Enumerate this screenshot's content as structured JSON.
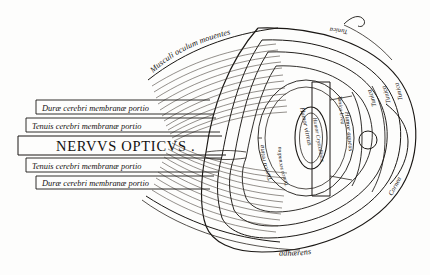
{
  "figure": {
    "kind": "anatomical-engraving",
    "language": "Latin",
    "ink_color": "#1a1714",
    "paper_color": "#fdfdfc"
  },
  "title_banner": {
    "text": "NERVVS OPTICVS .",
    "style": "roman-capitals"
  },
  "nerve_bands": [
    {
      "id": "band-1",
      "text": "Duræ cerebri membranæ portio"
    },
    {
      "id": "band-2",
      "text": "Tenuis cerebri membranæ portio"
    },
    {
      "id": "band-3",
      "text": "NERVVS OPTICVS .",
      "is_title": true
    },
    {
      "id": "band-4",
      "text": "Tenuis cerebri membranæ portio"
    },
    {
      "id": "band-5",
      "text": "Duræ cerebri membranæ portio"
    }
  ],
  "curved_labels": {
    "muscles": "Musculi oculum mouentes",
    "bottom": "adhærens",
    "tunica_outer": "Tunica",
    "tunica_middle": "Tunica",
    "tunica_inner": "Tunica",
    "tunica_top_mirrored": "Tunica"
  },
  "inner_labels": {
    "retina": "Tunica retina",
    "secundina": "Tunica secundina",
    "humor_vitreus": "Humor vitreus",
    "humor_crystallinus": "Humor Crystallinus",
    "humor_aqueus": "Humor aqueus",
    "tunica_uvea": "Tunica Uvea",
    "cornea": "Cornea"
  },
  "legend_order": [
    "Musculi oculum mouentes",
    "Duræ cerebri membranæ portio",
    "Tenuis cerebri membranæ portio",
    "NERVVS OPTICVS .",
    "Tunica retina",
    "Tunica secundina",
    "Humor vitreus",
    "Humor Crystallinus",
    "Humor aqueus",
    "Tunica Uvea",
    "Cornea",
    "adhærens"
  ]
}
